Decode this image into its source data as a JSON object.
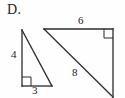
{
  "figure": {
    "part_label": "D.",
    "background_color": "#fefefe",
    "stroke_color": "#2b2b2b",
    "text_color": "#1c1c1c",
    "shapes": [
      {
        "name": "small-right-triangle",
        "type": "right-triangle",
        "right_angle_vertex": "bottom-left",
        "vertices": [
          {
            "x": 22,
            "y": 30
          },
          {
            "x": 22,
            "y": 86
          },
          {
            "x": 52,
            "y": 86
          }
        ],
        "side_labels": {
          "vertical_leg": "4",
          "horizontal_leg": "3",
          "hypotenuse": ""
        }
      },
      {
        "name": "large-right-triangle",
        "type": "right-triangle",
        "right_angle_vertex": "top-right",
        "vertices": [
          {
            "x": 44,
            "y": 29
          },
          {
            "x": 113,
            "y": 29
          },
          {
            "x": 113,
            "y": 97
          }
        ],
        "side_labels": {
          "horizontal_leg": "6",
          "vertical_leg": "",
          "hypotenuse": "8"
        }
      }
    ],
    "labels": [
      {
        "id": "leg-4",
        "text": "4",
        "shape": "small-right-triangle",
        "side": "vertical-leg",
        "x": 15,
        "y": 55
      },
      {
        "id": "leg-3",
        "text": "3",
        "shape": "small-right-triangle",
        "side": "horizontal-leg",
        "x": 36,
        "y": 91
      },
      {
        "id": "leg-6",
        "text": "6",
        "shape": "large-right-triangle",
        "side": "horizontal-leg",
        "x": 82,
        "y": 21
      },
      {
        "id": "hyp-8",
        "text": "8",
        "shape": "large-right-triangle",
        "side": "hypotenuse",
        "x": 76,
        "y": 73
      }
    ],
    "right_angle_markers": [
      {
        "id": "small-triangle-right-angle",
        "x": 22,
        "y": 77,
        "size": 9
      },
      {
        "id": "large-triangle-right-angle",
        "x": 104,
        "y": 29,
        "size": 9
      }
    ]
  }
}
